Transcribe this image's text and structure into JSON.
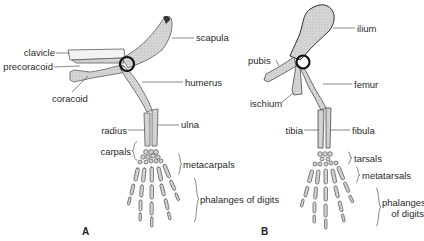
{
  "figure": {
    "panels": [
      {
        "id": "A",
        "label": "A",
        "labels": {
          "scapula": "scapula",
          "clavicle": "clavicle",
          "precoracoid": "precoracoid",
          "coracoid": "coracoid",
          "humerus": "humerus",
          "radius": "radius",
          "ulna": "ulna",
          "carpals": "carpals",
          "metacarpals": "metacarpals",
          "phalanges": "phalanges of digits"
        }
      },
      {
        "id": "B",
        "label": "B",
        "labels": {
          "ilium": "ilium",
          "pubis": "pubis",
          "ischium": "ischium",
          "femur": "femur",
          "tibia": "tibia",
          "fibula": "fibula",
          "tarsals": "tarsals",
          "metatarsals": "metatarsals",
          "phalanges_line1": "phalanges",
          "phalanges_line2": "of digits"
        }
      }
    ],
    "colors": {
      "bone_fill": "#d4d4d4",
      "bone_stroke": "#555555",
      "joint": "#111111",
      "leader": "#555555",
      "text": "#2a2a2a"
    }
  }
}
